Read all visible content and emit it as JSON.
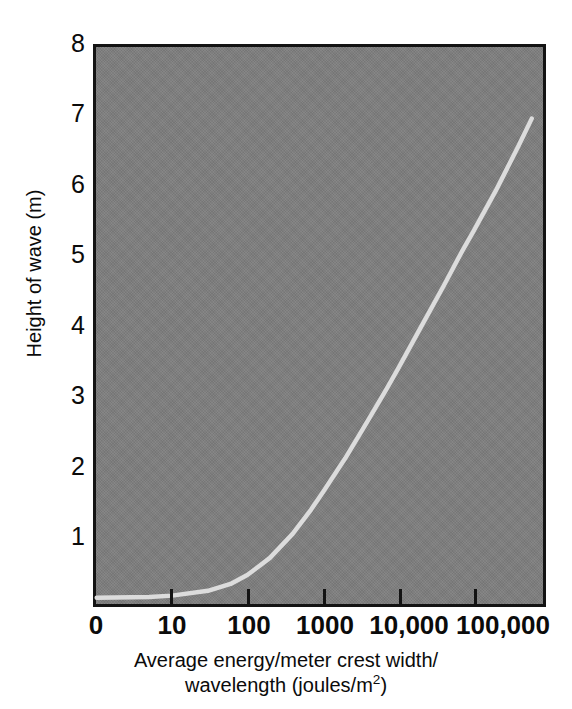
{
  "chart_data": {
    "type": "line",
    "title": "",
    "xlabel": "Average energy/meter crest width/ wavelength (joules/m²)",
    "xlabel_line1": "Average energy/meter crest width/",
    "xlabel_line2_prefix": "wavelength (joules/m",
    "xlabel_line2_sup": "2",
    "xlabel_line2_suffix": ")",
    "ylabel": "Height of wave (m)",
    "x_scale": "log",
    "y_scale": "linear",
    "xtick_labels": [
      "0",
      "10",
      "100",
      "1000",
      "10,000",
      "100,000"
    ],
    "xtick_values": [
      0,
      10,
      100,
      1000,
      10000,
      100000
    ],
    "ytick_labels": [
      "1",
      "2",
      "3",
      "4",
      "5",
      "6",
      "7",
      "8"
    ],
    "ytick_values": [
      1,
      2,
      3,
      4,
      5,
      6,
      7,
      8
    ],
    "y_origin_label": "0",
    "ylim": [
      0,
      8
    ],
    "grid": false,
    "legend": false,
    "series": [
      {
        "name": "Wave height vs energy",
        "color": "#dcdcdc",
        "x": [
          1,
          5,
          10,
          30,
          60,
          100,
          200,
          400,
          700,
          1000,
          2000,
          4000,
          7000,
          10000,
          20000,
          40000,
          70000,
          100000,
          200000,
          400000,
          600000
        ],
        "y": [
          0.02,
          0.03,
          0.05,
          0.12,
          0.22,
          0.35,
          0.6,
          0.95,
          1.3,
          1.55,
          2.05,
          2.6,
          3.05,
          3.35,
          3.95,
          4.55,
          5.05,
          5.35,
          5.95,
          6.6,
          7.0
        ]
      }
    ],
    "annotations": [],
    "colors": {
      "plot_background": "#7e7e7e",
      "axis": "#131313",
      "curve": "#dcdcdc",
      "text": "#0b0b0b",
      "page_background": "#ffffff"
    }
  }
}
